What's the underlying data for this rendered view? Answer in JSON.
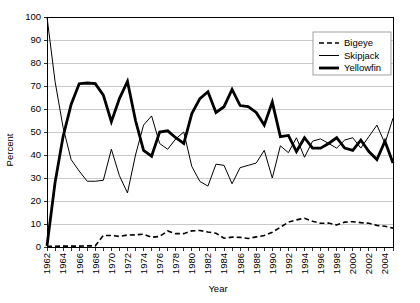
{
  "chart_data": {
    "type": "line",
    "title": "",
    "xlabel": "Year",
    "ylabel": "Percent",
    "xlim": [
      1962,
      2005
    ],
    "ylim": [
      0,
      100
    ],
    "ytick_step": 10,
    "xtick_step": 1,
    "xlabel_step": 2,
    "grid": true,
    "legend_position": "top-right",
    "x": [
      1962,
      1963,
      1964,
      1965,
      1966,
      1967,
      1968,
      1969,
      1970,
      1971,
      1972,
      1973,
      1974,
      1975,
      1976,
      1977,
      1978,
      1979,
      1980,
      1981,
      1982,
      1983,
      1984,
      1985,
      1986,
      1987,
      1988,
      1989,
      1990,
      1991,
      1992,
      1993,
      1994,
      1995,
      1996,
      1997,
      1998,
      1999,
      2000,
      2001,
      2002,
      2003,
      2004,
      2005
    ],
    "xticklabels": [
      "1962",
      "",
      "1964",
      "",
      "1966",
      "",
      "1968",
      "",
      "1970",
      "",
      "1972",
      "",
      "1974",
      "",
      "1976",
      "",
      "1978",
      "",
      "1980",
      "",
      "1982",
      "",
      "1984",
      "",
      "1986",
      "",
      "1988",
      "",
      "1990",
      "",
      "1992",
      "",
      "1994",
      "",
      "1996",
      "",
      "1998",
      "",
      "2000",
      "",
      "2002",
      "",
      "2004",
      ""
    ],
    "yticklabels": [
      "0",
      "10",
      "20",
      "30",
      "40",
      "50",
      "60",
      "70",
      "80",
      "90",
      "100"
    ],
    "series": [
      {
        "name": "Bigeye",
        "style": "dashed",
        "stroke_width": 1.6,
        "dasharray": "5,3",
        "values": [
          0.3,
          0.3,
          0.4,
          0.4,
          0.4,
          0.5,
          0.5,
          5.0,
          5.0,
          4.6,
          5.2,
          5.3,
          5.6,
          4.2,
          4.6,
          7.0,
          5.8,
          5.8,
          7.0,
          7.2,
          6.5,
          6.0,
          3.8,
          4.3,
          4.2,
          3.7,
          4.4,
          5.0,
          6.4,
          8.6,
          10.8,
          11.8,
          12.5,
          11.2,
          10.3,
          10.4,
          9.6,
          10.8,
          11.0,
          10.6,
          10.3,
          9.4,
          9.0,
          8.2
        ]
      },
      {
        "name": "Skipjack",
        "style": "solid-thin",
        "stroke_width": 1.0,
        "dasharray": "",
        "values": [
          100.0,
          72.0,
          52.0,
          38.0,
          33.0,
          28.6,
          28.6,
          29.0,
          42.5,
          31.0,
          23.5,
          40.0,
          53.0,
          57.0,
          45.0,
          42.5,
          47.0,
          50.0,
          35.0,
          28.5,
          26.5,
          36.0,
          35.5,
          27.5,
          34.5,
          35.5,
          36.5,
          42.0,
          30.0,
          44.0,
          41.0,
          47.5,
          39.0,
          46.0,
          47.0,
          45.0,
          43.0,
          46.5,
          47.5,
          43.0,
          48.0,
          53.0,
          45.0,
          56.0
        ]
      },
      {
        "name": "Yellowfin",
        "style": "solid-thick",
        "stroke_width": 2.8,
        "dasharray": "",
        "values": [
          0.5,
          28.0,
          48.0,
          62.0,
          71.0,
          71.3,
          71.0,
          66.0,
          54.5,
          64.5,
          72.0,
          55.0,
          42.0,
          39.5,
          50.0,
          50.5,
          47.5,
          45.0,
          58.0,
          64.5,
          67.5,
          58.5,
          61.0,
          68.5,
          61.5,
          61.0,
          58.5,
          53.0,
          63.0,
          48.0,
          48.5,
          41.5,
          47.5,
          43.0,
          43.0,
          45.0,
          47.5,
          43.0,
          42.0,
          46.5,
          41.5,
          38.0,
          46.0,
          36.5
        ]
      }
    ],
    "legend": [
      "Bigeye",
      "Skipjack",
      "Yellowfin"
    ]
  }
}
